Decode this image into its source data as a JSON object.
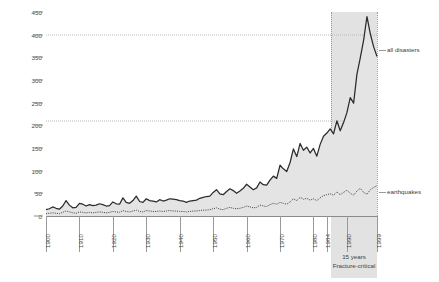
{
  "chart_data": {
    "type": "line",
    "title": "",
    "xlabel": "",
    "ylabel": "",
    "xlim": [
      1900,
      1999
    ],
    "ylim": [
      0,
      450
    ],
    "grid": "two dotted horizontal reference lines at 210 and 400",
    "legend_position": "right, inline labels at series ends",
    "y_ticks": [
      0,
      50,
      100,
      150,
      200,
      250,
      300,
      350,
      400,
      450
    ],
    "x_ticks": [
      1900,
      1910,
      1920,
      1930,
      1940,
      1950,
      1960,
      1970,
      1980,
      1984,
      1990,
      1999
    ],
    "reference_lines": [
      210,
      400
    ],
    "highlight_band": {
      "from": 1984,
      "to": 1999,
      "label_line1": "15 years",
      "label_line2": "Fracture-critical",
      "color": "#dcdcdc"
    },
    "series": [
      {
        "name": "all disasters",
        "style": "solid",
        "color": "#2b2b2b",
        "fill": "#e4e4e4",
        "x": [
          1900,
          1901,
          1902,
          1903,
          1904,
          1905,
          1906,
          1907,
          1908,
          1909,
          1910,
          1911,
          1912,
          1913,
          1914,
          1915,
          1916,
          1917,
          1918,
          1919,
          1920,
          1921,
          1922,
          1923,
          1924,
          1925,
          1926,
          1927,
          1928,
          1929,
          1930,
          1931,
          1932,
          1933,
          1934,
          1935,
          1936,
          1937,
          1938,
          1939,
          1940,
          1941,
          1942,
          1943,
          1944,
          1945,
          1946,
          1947,
          1948,
          1949,
          1950,
          1951,
          1952,
          1953,
          1954,
          1955,
          1956,
          1957,
          1958,
          1959,
          1960,
          1961,
          1962,
          1963,
          1964,
          1965,
          1966,
          1967,
          1968,
          1969,
          1970,
          1971,
          1972,
          1973,
          1974,
          1975,
          1976,
          1977,
          1978,
          1979,
          1980,
          1981,
          1982,
          1983,
          1984,
          1985,
          1986,
          1987,
          1988,
          1989,
          1990,
          1991,
          1992,
          1993,
          1994,
          1995,
          1996,
          1997,
          1998,
          1999
        ],
        "values": [
          14,
          16,
          20,
          17,
          15,
          22,
          34,
          24,
          18,
          19,
          28,
          26,
          22,
          25,
          23,
          24,
          27,
          25,
          22,
          23,
          31,
          27,
          26,
          40,
          30,
          28,
          34,
          44,
          32,
          30,
          38,
          34,
          33,
          31,
          36,
          33,
          35,
          38,
          37,
          36,
          34,
          33,
          30,
          33,
          34,
          35,
          39,
          41,
          43,
          44,
          52,
          58,
          49,
          47,
          54,
          60,
          56,
          50,
          55,
          61,
          70,
          64,
          58,
          62,
          75,
          69,
          68,
          79,
          88,
          83,
          112,
          104,
          98,
          118,
          148,
          131,
          160,
          145,
          152,
          139,
          149,
          132,
          158,
          176,
          183,
          192,
          181,
          210,
          188,
          206,
          228,
          261,
          249,
          313,
          349,
          388,
          440,
          402,
          373,
          352
        ]
      },
      {
        "name": "earthquakes",
        "style": "dotted",
        "color": "#4a4a4a",
        "x": [
          1900,
          1901,
          1902,
          1903,
          1904,
          1905,
          1906,
          1907,
          1908,
          1909,
          1910,
          1911,
          1912,
          1913,
          1914,
          1915,
          1916,
          1917,
          1918,
          1919,
          1920,
          1921,
          1922,
          1923,
          1924,
          1925,
          1926,
          1927,
          1928,
          1929,
          1930,
          1931,
          1932,
          1933,
          1934,
          1935,
          1936,
          1937,
          1938,
          1939,
          1940,
          1941,
          1942,
          1943,
          1944,
          1945,
          1946,
          1947,
          1948,
          1949,
          1950,
          1951,
          1952,
          1953,
          1954,
          1955,
          1956,
          1957,
          1958,
          1959,
          1960,
          1961,
          1962,
          1963,
          1964,
          1965,
          1966,
          1967,
          1968,
          1969,
          1970,
          1971,
          1972,
          1973,
          1974,
          1975,
          1976,
          1977,
          1978,
          1979,
          1980,
          1981,
          1982,
          1983,
          1984,
          1985,
          1986,
          1987,
          1988,
          1989,
          1990,
          1991,
          1992,
          1993,
          1994,
          1995,
          1996,
          1997,
          1998,
          1999
        ],
        "values": [
          5,
          6,
          7,
          6,
          5,
          8,
          11,
          9,
          7,
          6,
          9,
          8,
          7,
          8,
          7,
          8,
          9,
          8,
          7,
          8,
          10,
          9,
          8,
          12,
          10,
          9,
          11,
          13,
          10,
          9,
          12,
          11,
          10,
          10,
          11,
          10,
          11,
          12,
          11,
          11,
          10,
          10,
          9,
          10,
          11,
          11,
          12,
          13,
          13,
          14,
          16,
          18,
          15,
          14,
          17,
          19,
          17,
          16,
          17,
          19,
          22,
          20,
          18,
          19,
          24,
          22,
          21,
          25,
          28,
          26,
          30,
          28,
          26,
          31,
          38,
          34,
          41,
          37,
          39,
          35,
          38,
          34,
          40,
          45,
          47,
          49,
          46,
          53,
          47,
          52,
          57,
          50,
          46,
          55,
          61,
          52,
          48,
          58,
          63,
          67
        ]
      }
    ]
  }
}
